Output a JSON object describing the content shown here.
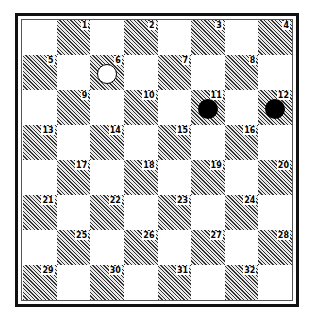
{
  "diagram": {
    "type": "checkers-board",
    "rows": 8,
    "cols": 8,
    "colors": {
      "dark_square": "#bdbdbd",
      "light_square": "#ffffff",
      "black_piece": "#000000",
      "white_piece": "#ffffff"
    },
    "squares": [
      {
        "n": "1",
        "row": 0,
        "col": 1
      },
      {
        "n": "2",
        "row": 0,
        "col": 3
      },
      {
        "n": "3",
        "row": 0,
        "col": 5
      },
      {
        "n": "4",
        "row": 0,
        "col": 7
      },
      {
        "n": "5",
        "row": 1,
        "col": 0
      },
      {
        "n": "6",
        "row": 1,
        "col": 2
      },
      {
        "n": "7",
        "row": 1,
        "col": 4
      },
      {
        "n": "8",
        "row": 1,
        "col": 6
      },
      {
        "n": "9",
        "row": 2,
        "col": 1
      },
      {
        "n": "10",
        "row": 2,
        "col": 3
      },
      {
        "n": "11",
        "row": 2,
        "col": 5
      },
      {
        "n": "12",
        "row": 2,
        "col": 7
      },
      {
        "n": "13",
        "row": 3,
        "col": 0
      },
      {
        "n": "14",
        "row": 3,
        "col": 2
      },
      {
        "n": "15",
        "row": 3,
        "col": 4
      },
      {
        "n": "16",
        "row": 3,
        "col": 6
      },
      {
        "n": "17",
        "row": 4,
        "col": 1
      },
      {
        "n": "18",
        "row": 4,
        "col": 3
      },
      {
        "n": "19",
        "row": 4,
        "col": 5
      },
      {
        "n": "20",
        "row": 4,
        "col": 7
      },
      {
        "n": "21",
        "row": 5,
        "col": 0
      },
      {
        "n": "22",
        "row": 5,
        "col": 2
      },
      {
        "n": "23",
        "row": 5,
        "col": 4
      },
      {
        "n": "24",
        "row": 5,
        "col": 6
      },
      {
        "n": "25",
        "row": 6,
        "col": 1
      },
      {
        "n": "26",
        "row": 6,
        "col": 3
      },
      {
        "n": "27",
        "row": 6,
        "col": 5
      },
      {
        "n": "28",
        "row": 6,
        "col": 7
      },
      {
        "n": "29",
        "row": 7,
        "col": 0
      },
      {
        "n": "30",
        "row": 7,
        "col": 2
      },
      {
        "n": "31",
        "row": 7,
        "col": 4
      },
      {
        "n": "32",
        "row": 7,
        "col": 6
      }
    ],
    "pieces": [
      {
        "square": "6",
        "color": "white"
      },
      {
        "square": "11",
        "color": "black"
      },
      {
        "square": "12",
        "color": "black"
      }
    ]
  }
}
